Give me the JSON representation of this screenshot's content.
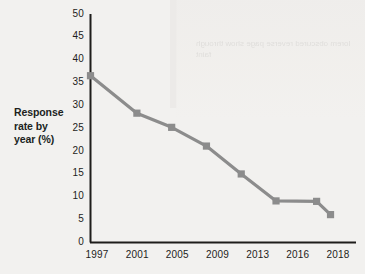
{
  "chart_data": {
    "type": "line",
    "title": "",
    "xlabel": "",
    "ylabel": "Response rate by year (%)",
    "ylim": [
      0,
      50
    ],
    "yticks": [
      0,
      5,
      10,
      15,
      20,
      25,
      30,
      35,
      40,
      45,
      50
    ],
    "xticks": [
      "1997",
      "2001",
      "2005",
      "2009",
      "2013",
      "2016",
      "2018"
    ],
    "xlim": [
      1997,
      2018
    ],
    "grid": false,
    "legend": null,
    "series": [
      {
        "name": "Response rate by year (%)",
        "color": "#8c8c8c",
        "marker": "square",
        "x": [
          1997,
          2001,
          2004,
          2007,
          2010,
          2013,
          2016.5,
          2017.7
        ],
        "values": [
          36.5,
          28.3,
          25.2,
          21.1,
          15.0,
          9.1,
          9.0,
          6.1
        ]
      }
    ]
  },
  "axis": {
    "y_title_line1": "Response",
    "y_title_line2": "rate by",
    "y_title_line3": "year (%)",
    "y_labels": [
      "50",
      "45",
      "40",
      "35",
      "30",
      "25",
      "20",
      "15",
      "10",
      "5",
      "0"
    ],
    "x_labels": [
      "1997",
      "2001",
      "2005",
      "2009",
      "2013",
      "2016",
      "2018"
    ]
  },
  "colors": {
    "line": "#8c8c8c",
    "marker": "#8c8c8c",
    "axis": "#1e1d1b",
    "text": "#1e1d1b",
    "background": "#f2f1ef"
  },
  "bleed_text": "lorem obscured reverse page show through faint"
}
